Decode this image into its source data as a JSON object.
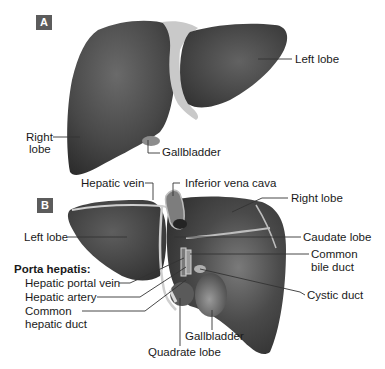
{
  "figure": {
    "panel_a": {
      "badge": "A",
      "labels": {
        "left_lobe": "Left lobe",
        "right_lobe_line1": "Right",
        "right_lobe_line2": "lobe",
        "gallbladder": "Gallbladder"
      }
    },
    "panel_b": {
      "badge": "B",
      "labels": {
        "hepatic_vein": "Hepatic vein",
        "inferior_vena_cava": "Inferior vena cava",
        "right_lobe": "Right lobe",
        "left_lobe": "Left lobe",
        "caudate_lobe": "Caudate lobe",
        "common_bile_duct_line1": "Common",
        "common_bile_duct_line2": "bile duct",
        "porta_hepatis_heading": "Porta hepatis:",
        "hepatic_portal_vein": "Hepatic portal vein",
        "hepatic_artery": "Hepatic artery",
        "common_hepatic_duct_line1": "Common",
        "common_hepatic_duct_line2": "hepatic duct",
        "cystic_duct": "Cystic duct",
        "gallbladder": "Gallbladder",
        "quadrate_lobe": "Quadrate lobe"
      }
    },
    "colors": {
      "organ_dark": "#3e3e3e",
      "organ_mid": "#5a5a5a",
      "organ_light": "#8a8a8a",
      "ligament": "#cfcfcf",
      "badge_bg": "#5c5c5c",
      "leader_line": "#333333",
      "background": "#ffffff"
    }
  }
}
